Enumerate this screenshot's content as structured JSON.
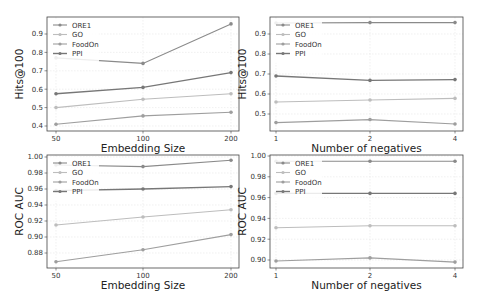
{
  "chart_data": [
    {
      "type": "line",
      "panel": "top-left",
      "title": "",
      "xlabel": "Embedding Size",
      "ylabel": "Hits@100",
      "categories": [
        "50",
        "100",
        "200"
      ],
      "yticks": [
        "0.4",
        "0.5",
        "0.6",
        "0.7",
        "0.8",
        "0.9"
      ],
      "ylim": [
        0.39,
        0.98
      ],
      "grid": true,
      "legend_position": "upper left",
      "series": [
        {
          "name": "ORE1",
          "values": [
            0.77,
            0.74,
            0.955
          ]
        },
        {
          "name": "GO",
          "values": [
            0.5,
            0.545,
            0.575
          ]
        },
        {
          "name": "FoodOn",
          "values": [
            0.41,
            0.455,
            0.475
          ]
        },
        {
          "name": "PPI",
          "values": [
            0.575,
            0.61,
            0.69
          ]
        }
      ]
    },
    {
      "type": "line",
      "panel": "top-right",
      "title": "",
      "xlabel": "Number of negatives",
      "ylabel": "Hits@100",
      "categories": [
        "1",
        "2",
        "4"
      ],
      "yticks": [
        "0.5",
        "0.6",
        "0.7",
        "0.8",
        "0.9"
      ],
      "ylim": [
        0.44,
        0.98
      ],
      "grid": true,
      "legend_position": "upper left",
      "series": [
        {
          "name": "ORE1",
          "values": [
            0.955,
            0.957,
            0.957
          ]
        },
        {
          "name": "GO",
          "values": [
            0.56,
            0.57,
            0.578
          ]
        },
        {
          "name": "FoodOn",
          "values": [
            0.457,
            0.472,
            0.45
          ]
        },
        {
          "name": "PPI",
          "values": [
            0.69,
            0.668,
            0.672
          ]
        }
      ]
    },
    {
      "type": "line",
      "panel": "bottom-left",
      "title": "",
      "xlabel": "Embedding Size",
      "ylabel": "ROC AUC",
      "categories": [
        "50",
        "100",
        "200"
      ],
      "yticks": [
        "0.88",
        "0.90",
        "0.92",
        "0.94",
        "0.96",
        "0.98",
        "1.00"
      ],
      "ylim": [
        0.866,
        1.001
      ],
      "grid": true,
      "legend_position": "upper left",
      "series": [
        {
          "name": "ORE1",
          "values": [
            0.99,
            0.988,
            0.996
          ]
        },
        {
          "name": "GO",
          "values": [
            0.915,
            0.925,
            0.934
          ]
        },
        {
          "name": "FoodOn",
          "values": [
            0.869,
            0.884,
            0.903
          ]
        },
        {
          "name": "PPI",
          "values": [
            0.958,
            0.96,
            0.963
          ]
        }
      ]
    },
    {
      "type": "line",
      "panel": "bottom-right",
      "title": "",
      "xlabel": "Number of negatives",
      "ylabel": "ROC AUC",
      "categories": [
        "1",
        "2",
        "4"
      ],
      "yticks": [
        "0.90",
        "0.92",
        "0.94",
        "0.96",
        "0.98",
        "1.00"
      ],
      "ylim": [
        0.894,
        1.001
      ],
      "grid": true,
      "legend_position": "upper left",
      "series": [
        {
          "name": "ORE1",
          "values": [
            0.995,
            0.995,
            0.995
          ]
        },
        {
          "name": "GO",
          "values": [
            0.931,
            0.933,
            0.933
          ]
        },
        {
          "name": "FoodOn",
          "values": [
            0.899,
            0.902,
            0.898
          ]
        },
        {
          "name": "PPI",
          "values": [
            0.964,
            0.964,
            0.964
          ]
        }
      ]
    }
  ],
  "series_colors": {
    "ORE1": "#8a8a8a",
    "GO": "#bdbdbd",
    "FoodOn": "#9e9e9e",
    "PPI": "#777777"
  },
  "legend_labels": [
    "ORE1",
    "GO",
    "FoodOn",
    "PPI"
  ]
}
